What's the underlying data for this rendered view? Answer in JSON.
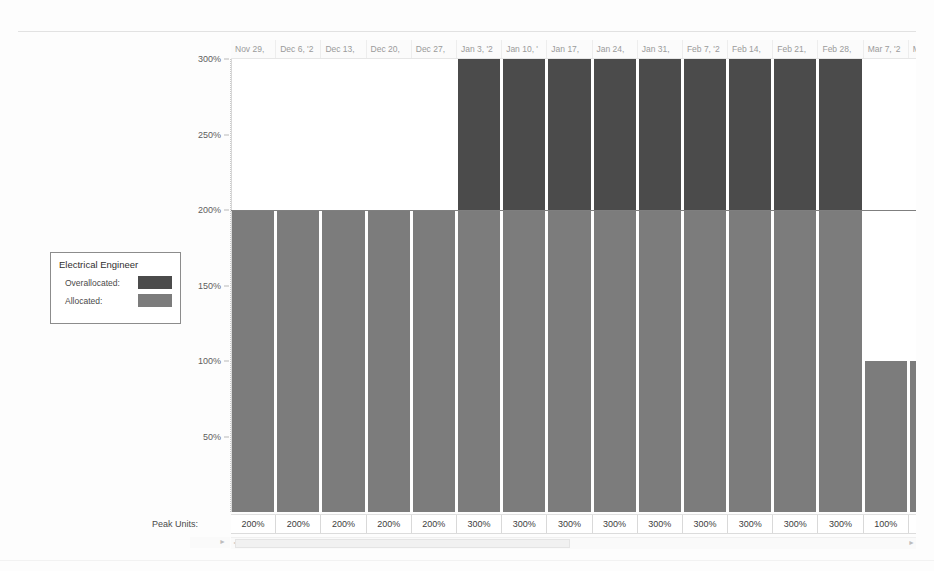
{
  "chart_data": {
    "type": "bar",
    "title": "Electrical Engineer",
    "xlabel": "",
    "ylabel": "",
    "ylim": [
      0,
      300
    ],
    "grid": false,
    "legend_position": "left",
    "y_ticks": [
      "50%",
      "100%",
      "150%",
      "200%",
      "250%",
      "300%"
    ],
    "y_tick_values": [
      50,
      100,
      150,
      200,
      250,
      300
    ],
    "reference_line": 200,
    "categories": [
      "Nov 29,",
      "Dec 6, '2",
      "Dec 13,",
      "Dec 20,",
      "Dec 27,",
      "Jan 3, '2",
      "Jan 10, '",
      "Jan 17,",
      "Jan 24,",
      "Jan 31,",
      "Feb 7, '2",
      "Feb 14,",
      "Feb 21,",
      "Feb 28,",
      "Mar 7, '2",
      "Mar"
    ],
    "values": [
      200,
      200,
      200,
      200,
      200,
      300,
      300,
      300,
      300,
      300,
      300,
      300,
      300,
      300,
      100,
      100
    ],
    "series": [
      {
        "name": "Allocated:",
        "color": "#7c7c7c",
        "values": [
          200,
          200,
          200,
          200,
          200,
          200,
          200,
          200,
          200,
          200,
          200,
          200,
          200,
          200,
          100,
          100
        ]
      },
      {
        "name": "Overallocated:",
        "color": "#4b4b4b",
        "values": [
          0,
          0,
          0,
          0,
          0,
          100,
          100,
          100,
          100,
          100,
          100,
          100,
          100,
          100,
          0,
          0
        ]
      }
    ],
    "data_labels": [
      "200%",
      "200%",
      "200%",
      "200%",
      "200%",
      "300%",
      "300%",
      "300%",
      "300%",
      "300%",
      "300%",
      "300%",
      "300%",
      "300%",
      "100%",
      "100"
    ]
  },
  "legend": {
    "title": "Electrical Engineer",
    "items": [
      {
        "label": "Overallocated:",
        "color": "#4b4b4b"
      },
      {
        "label": "Allocated:",
        "color": "#7c7c7c"
      }
    ]
  },
  "peak_units": {
    "row_label": "Peak Units:"
  },
  "scrollbar": {
    "left_arrow": "◄",
    "right_arrow": "►",
    "nav_arrow": "►"
  }
}
